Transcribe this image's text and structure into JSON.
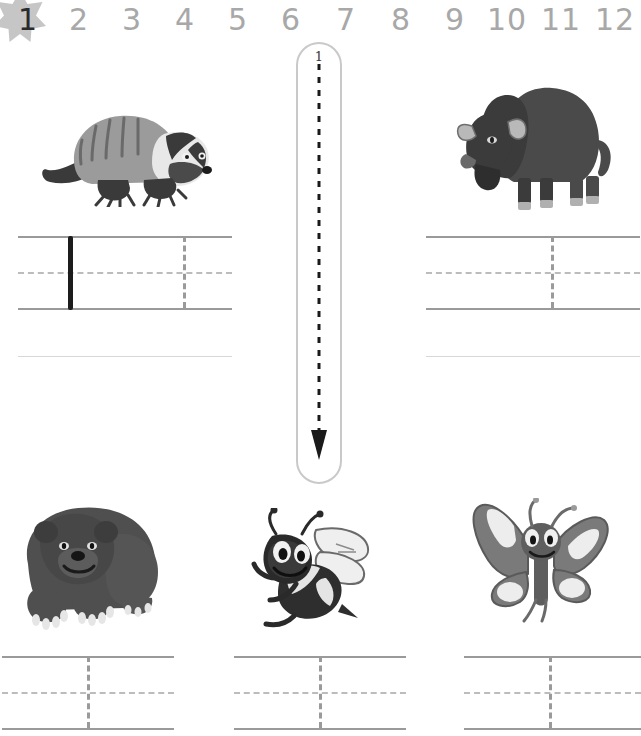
{
  "worksheet": {
    "title": "Number 1 Tracing Worksheet",
    "focus_number": "1",
    "colors": {
      "number_strip": "#a8a8a8",
      "active_number": "#2b2b2b",
      "star": "#c6c6c6",
      "rule_line": "#9a9a9a",
      "dashed_guide": "#bcbcbc",
      "baseline": "#d8d8d8",
      "stroke_outline": "#c9c9c9",
      "traced_mark": "#1c1c1c"
    }
  },
  "number_strip": {
    "name": "number-line-1-to-12",
    "numbers": [
      "1",
      "2",
      "3",
      "4",
      "5",
      "6",
      "7",
      "8",
      "9",
      "10",
      "11",
      "12"
    ],
    "highlighted": "1",
    "star_icon": "star-icon"
  },
  "stroke_guide": {
    "name": "number-1-stroke-guide",
    "glyph": "1",
    "stroke_order_label": "1",
    "arrow_direction": "down",
    "arrow_style": "dashed"
  },
  "animals": [
    {
      "name": "badger-illustration",
      "label": "badger",
      "position": "top-left"
    },
    {
      "name": "bison-illustration",
      "label": "bison",
      "position": "top-right"
    },
    {
      "name": "bear-illustration",
      "label": "bear",
      "position": "bottom-left"
    },
    {
      "name": "bee-illustration",
      "label": "bee",
      "position": "bottom-center"
    },
    {
      "name": "butterfly-illustration",
      "label": "butterfly",
      "position": "bottom-right"
    }
  ],
  "practice_rows": [
    {
      "name": "practice-lines-top-left",
      "traced_example": "1",
      "has_traced_example": true,
      "guide_marks": 1
    },
    {
      "name": "practice-lines-top-right",
      "traced_example": "",
      "has_traced_example": false,
      "guide_marks": 1
    },
    {
      "name": "practice-lines-bottom-left",
      "traced_example": "",
      "has_traced_example": false,
      "guide_marks": 1
    },
    {
      "name": "practice-lines-bottom-center",
      "traced_example": "",
      "has_traced_example": false,
      "guide_marks": 1
    },
    {
      "name": "practice-lines-bottom-right",
      "traced_example": "",
      "has_traced_example": false,
      "guide_marks": 1
    }
  ]
}
